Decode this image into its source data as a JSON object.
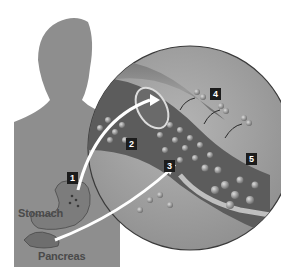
{
  "figure": {
    "labels": {
      "stomach": "Stomach",
      "pancreas": "Pancreas"
    },
    "steps": [
      {
        "id": "step-1",
        "number": "1"
      },
      {
        "id": "step-2",
        "number": "2"
      },
      {
        "id": "step-3",
        "number": "3"
      },
      {
        "id": "step-4",
        "number": "4"
      },
      {
        "id": "step-5",
        "number": "5"
      }
    ],
    "colors": {
      "silhouette": "#8e8e8e",
      "magnified_circle": "#a8a8a8",
      "vessel": "#5a5a5a",
      "arrow": "#ffffff",
      "badge": "#1c1c1c"
    }
  }
}
